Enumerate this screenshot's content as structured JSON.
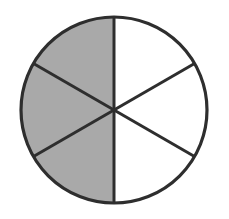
{
  "figure": {
    "kind": "fraction-circle-diagram",
    "title": "Circle divided into six equal sectors with three shaded",
    "background_color": "#ffffff"
  },
  "chart_data": {
    "type": "pie",
    "title": "Circle divided into six equal sectors with three shaded",
    "subtitle": "",
    "xlabel": "",
    "ylabel": "",
    "total_slices": 6,
    "shaded_slices": 3,
    "unshaded_slices": 3,
    "fraction_shaded": "3/6",
    "fraction_shaded_decimal": 0.5,
    "percent_shaded": 50,
    "slice_angle_degrees": 60,
    "categories": [
      "sector-1-upper-right",
      "sector-2-right",
      "sector-3-lower-right",
      "sector-4-lower-left",
      "sector-5-left",
      "sector-6-upper-left"
    ],
    "values": [
      1,
      1,
      1,
      1,
      1,
      1
    ],
    "series": [
      {
        "name": "sector-fill-state",
        "values": [
          "unshaded",
          "unshaded",
          "unshaded",
          "shaded",
          "shaded",
          "shaded"
        ]
      }
    ],
    "legend": [],
    "legend_position": "none",
    "grid": false,
    "annotations": []
  },
  "geometry": {
    "center_x": 114,
    "center_y": 110,
    "radius": 93,
    "sector_count": 6,
    "sector_angle_degrees": 60,
    "diameter_lines": 3,
    "start_angle_degrees": -90,
    "sectors": [
      {
        "name": "sector-1-upper-right",
        "start_deg": -90,
        "end_deg": -30,
        "fill": "unshaded"
      },
      {
        "name": "sector-2-right",
        "start_deg": -30,
        "end_deg": 30,
        "fill": "unshaded"
      },
      {
        "name": "sector-3-lower-right",
        "start_deg": 30,
        "end_deg": 90,
        "fill": "unshaded"
      },
      {
        "name": "sector-4-lower-left",
        "start_deg": 90,
        "end_deg": 150,
        "fill": "shaded"
      },
      {
        "name": "sector-5-left",
        "start_deg": 150,
        "end_deg": 210,
        "fill": "shaded"
      },
      {
        "name": "sector-6-upper-left",
        "start_deg": 210,
        "end_deg": 270,
        "fill": "shaded"
      }
    ]
  },
  "colors": {
    "shaded_fill": "#a9a9a9",
    "unshaded_fill": "#ffffff",
    "stroke": "#2e2e2e",
    "background": "#ffffff"
  },
  "stroke": {
    "outline_width": 3.2,
    "divider_width": 3.0
  }
}
